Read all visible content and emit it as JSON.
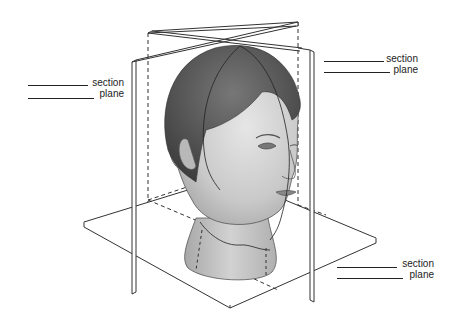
{
  "figure": {
    "colors": {
      "plane_stroke": "#333333",
      "plane_fill": "#ffffff",
      "hair": "#5a5a5a",
      "skin": "#c8c8c8",
      "background": "#ffffff"
    }
  },
  "labels": [
    {
      "id": "left",
      "line1": "section",
      "line2": "plane"
    },
    {
      "id": "top-right",
      "line1": "section",
      "line2": "plane"
    },
    {
      "id": "bottom-right",
      "line1": "section",
      "line2": "plane"
    }
  ]
}
